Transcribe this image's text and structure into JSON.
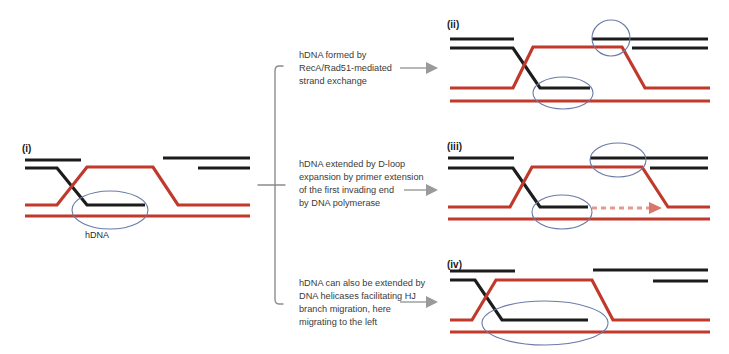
{
  "figure": {
    "background_color": "#ffffff",
    "colors": {
      "red_strand": "#c0392b",
      "black_strand": "#1c1c1c",
      "ellipse_highlight": "#6b7ba8",
      "connector_gray": "#8c8c8c",
      "arrow_gray": "#9a9a9a",
      "dashed_arrow": "#e59a90",
      "text": "#3a3a3a"
    }
  },
  "panels": {
    "initial": {
      "label": "(i)",
      "hdna_label": "hDNA",
      "ellipse_count": 1,
      "has_dashed_arrow": false
    },
    "ii": {
      "label": "(ii)",
      "ellipse_count": 2,
      "has_dashed_arrow": false
    },
    "iii": {
      "label": "(iii)",
      "ellipse_count": 2,
      "has_dashed_arrow": true
    },
    "iv": {
      "label": "(iv)",
      "ellipse_count": 1,
      "has_dashed_arrow": false
    }
  },
  "steps": [
    {
      "id": "step-ii",
      "lines": [
        "hDNA formed by",
        "RecA/Rad51-mediated",
        "strand exchange"
      ]
    },
    {
      "id": "step-iii",
      "lines": [
        "hDNA  extended by D-loop",
        "expansion by primer extension",
        "of the first invading end",
        "by  DNA polymerase"
      ]
    },
    {
      "id": "step-iv",
      "lines": [
        "hDNA can also be extended by",
        "DNA helicases facilitating HJ",
        "branch migration, here",
        "migrating to the left"
      ]
    }
  ]
}
